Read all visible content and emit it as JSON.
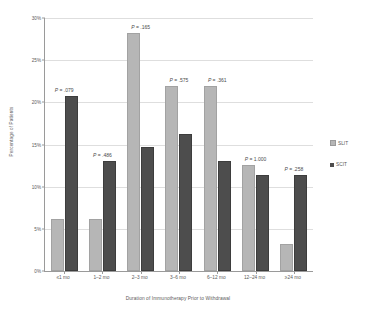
{
  "chart_data": {
    "type": "bar",
    "title": "",
    "xlabel": "Duration of Immunotherapy Prior to Withdrawal",
    "ylabel": "Percentage of Patients",
    "categories": [
      "≤1 mo",
      "1–2 mo",
      "2–3 mo",
      "3–6 mo",
      "6–12 mo",
      "12–24 mo",
      "≥24 mo"
    ],
    "series": [
      {
        "name": "SLIT",
        "color": "#b6b6b6",
        "values": [
          6.2,
          6.2,
          28.2,
          21.9,
          21.9,
          12.6,
          3.2
        ]
      },
      {
        "name": "SCIT",
        "color": "#4d4d4d",
        "values": [
          20.8,
          13.1,
          14.7,
          16.2,
          13.1,
          11.4,
          11.4
        ]
      }
    ],
    "annotations": [
      {
        "text": "P = .079",
        "group": 0
      },
      {
        "text": "P = .486",
        "group": 1
      },
      {
        "text": "P = .165",
        "group": 2
      },
      {
        "text": "P = .575",
        "group": 3
      },
      {
        "text": "P = .361",
        "group": 4
      },
      {
        "text": "P = 1.000",
        "group": 5
      },
      {
        "text": "P = .258",
        "group": 6
      }
    ],
    "ylim": [
      0,
      30
    ],
    "yticks": [
      0,
      5,
      10,
      15,
      20,
      25,
      30
    ],
    "ytick_labels": [
      "0%",
      "5%",
      "10%",
      "15%",
      "20%",
      "25%",
      "30%"
    ],
    "grid": true,
    "legend_position": "right"
  },
  "legend": {
    "items": [
      {
        "label": "SLIT"
      },
      {
        "label": "SCIT"
      }
    ]
  }
}
